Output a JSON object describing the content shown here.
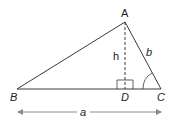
{
  "diagram": {
    "type": "triangle-altitude",
    "vertices": {
      "A": {
        "label": "A",
        "x": 125,
        "y": 22
      },
      "B": {
        "label": "B",
        "x": 17,
        "y": 89
      },
      "C": {
        "label": "C",
        "x": 161,
        "y": 89
      },
      "D": {
        "label": "D",
        "x": 125,
        "y": 89
      }
    },
    "labels": {
      "altitude": "h",
      "side_ac": "b",
      "base": "a"
    },
    "colors": {
      "line": "#3a3a3a",
      "arrow": "#8a8a8a",
      "text": "#222222"
    }
  }
}
